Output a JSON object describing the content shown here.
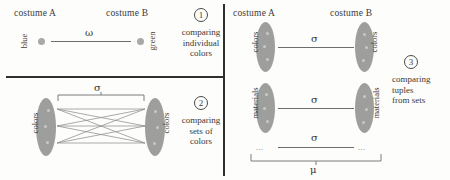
{
  "figure": {
    "panels": [
      {
        "id": "panel-1",
        "number": "1",
        "headers": {
          "left": "costume A",
          "right": "costume B"
        },
        "left_label": "blue",
        "right_label": "green",
        "relation_symbol": "ω",
        "caption_lines": [
          "comparing",
          "individual",
          "colors"
        ]
      },
      {
        "id": "panel-2",
        "number": "2",
        "left_label": "colors",
        "right_label": "colors",
        "relation_symbol": "σ",
        "caption_lines": [
          "comparing",
          "sets of",
          "colors"
        ]
      },
      {
        "id": "panel-3",
        "number": "3",
        "headers": {
          "left": "costume A",
          "right": "costume B"
        },
        "rows": [
          {
            "left_label": "colors",
            "right_label": "colors",
            "relation_symbol": "σ"
          },
          {
            "left_label": "materials",
            "right_label": "materials",
            "relation_symbol": "σ"
          }
        ],
        "ellipsis": "...",
        "tail_symbol": "σ",
        "group_symbol": "μ",
        "caption_lines": [
          "comparing",
          "tuples",
          "from sets"
        ]
      }
    ],
    "colors": {
      "ink": "#3a3a38",
      "rule": "#2f2f2e",
      "line": "#6d6d6b",
      "ellipse_fill": "#9e9e9c",
      "dot_fill": "#a9a9a7",
      "background": "#fdfdfb"
    }
  }
}
